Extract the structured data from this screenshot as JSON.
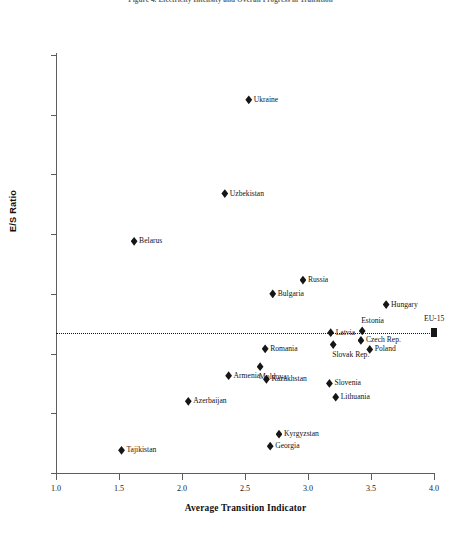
{
  "chart_data": {
    "type": "scatter",
    "title": "Figure 4. Electricity Intensity and Overall Progress in Transition",
    "xlabel": "Average Transition Indicator",
    "ylabel": "E/S Ratio",
    "xlim": [
      1.0,
      4.0
    ],
    "ylim": [
      0.0,
      0.7
    ],
    "xticks": [
      "1.0",
      "1.5",
      "2.0",
      "2.5",
      "3.0",
      "3.5",
      "4.0"
    ],
    "yticks": [
      "0.00",
      "0.10",
      "0.20",
      "0.30",
      "0.40",
      "0.50",
      "0.60",
      "0.70"
    ],
    "grid": false,
    "legend": "none",
    "marker_color": "#161616",
    "reference_line": {
      "label": "EU-15",
      "y": 0.235,
      "x_start": 1.0,
      "x_end": 4.0,
      "style": "dotted",
      "endpoint_marker": "square"
    },
    "points": [
      {
        "label": "Ukraine",
        "x": 2.53,
        "y": 0.625,
        "label_pos": "right"
      },
      {
        "label": "Uzbekistan",
        "x": 2.34,
        "y": 0.468,
        "label_pos": "right"
      },
      {
        "label": "Belarus",
        "x": 1.62,
        "y": 0.388,
        "label_pos": "right"
      },
      {
        "label": "Russia",
        "x": 2.96,
        "y": 0.323,
        "label_pos": "right"
      },
      {
        "label": "Bulgaria",
        "x": 2.72,
        "y": 0.3,
        "label_pos": "right"
      },
      {
        "label": "Hungary",
        "x": 3.62,
        "y": 0.282,
        "label_pos": "right"
      },
      {
        "label": "Estonia",
        "x": 3.43,
        "y": 0.238,
        "label_pos": "above"
      },
      {
        "label": "Latvia",
        "x": 3.18,
        "y": 0.235,
        "label_pos": "right"
      },
      {
        "label": "Czech Rep.",
        "x": 3.42,
        "y": 0.222,
        "label_pos": "right"
      },
      {
        "label": "Slovak Rep.",
        "x": 3.2,
        "y": 0.215,
        "label_pos": "below"
      },
      {
        "label": "Poland",
        "x": 3.49,
        "y": 0.207,
        "label_pos": "right"
      },
      {
        "label": "Romania",
        "x": 2.66,
        "y": 0.208,
        "label_pos": "right"
      },
      {
        "label": "Moldova",
        "x": 2.62,
        "y": 0.178,
        "label_pos": "below"
      },
      {
        "label": "Armenia",
        "x": 2.37,
        "y": 0.163,
        "label_pos": "right"
      },
      {
        "label": "Kazakhstan",
        "x": 2.67,
        "y": 0.157,
        "label_pos": "right"
      },
      {
        "label": "Slovenia",
        "x": 3.17,
        "y": 0.15,
        "label_pos": "right"
      },
      {
        "label": "Lithuania",
        "x": 3.22,
        "y": 0.127,
        "label_pos": "right"
      },
      {
        "label": "Azerbaijan",
        "x": 2.05,
        "y": 0.12,
        "label_pos": "right"
      },
      {
        "label": "Kyrgyzstan",
        "x": 2.77,
        "y": 0.065,
        "label_pos": "right"
      },
      {
        "label": "Georgia",
        "x": 2.7,
        "y": 0.045,
        "label_pos": "right"
      },
      {
        "label": "Tajikistan",
        "x": 1.52,
        "y": 0.038,
        "label_pos": "right"
      }
    ]
  }
}
